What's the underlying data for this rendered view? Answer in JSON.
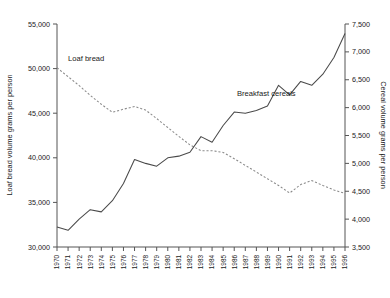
{
  "chart_data": {
    "type": "line",
    "title": "",
    "xlabel": "",
    "grid": false,
    "legend_position": "inline-annotation",
    "x": [
      1970,
      1971,
      1972,
      1973,
      1974,
      1975,
      1976,
      1977,
      1978,
      1979,
      1980,
      1981,
      1982,
      1983,
      1984,
      1985,
      1986,
      1987,
      1988,
      1989,
      1990,
      1991,
      1992,
      1993,
      1994,
      1995,
      1996
    ],
    "xtick_labels": [
      "1970",
      "1971",
      "1972",
      "1973",
      "1974",
      "1975",
      "1976",
      "1977",
      "1978",
      "1979",
      "1980",
      "1981",
      "1982",
      "1983",
      "1984",
      "1985",
      "1986",
      "1987",
      "1988",
      "1989",
      "1990",
      "1991",
      "1992",
      "1993",
      "1994",
      "1995",
      "1996"
    ],
    "axes": [
      {
        "id": "left",
        "label": "Loaf bread volume grams per person",
        "ylim": [
          30000,
          55000
        ],
        "tick_values": [
          30000,
          35000,
          40000,
          45000,
          50000,
          55000
        ],
        "tick_labels": [
          "30,000",
          "35,000",
          "40,000",
          "45,000",
          "50,000",
          "55,000"
        ]
      },
      {
        "id": "right",
        "label": "Cereal volume grams per person",
        "ylim": [
          3500,
          7500
        ],
        "tick_values": [
          3500,
          4000,
          4500,
          5000,
          5500,
          6000,
          6500,
          7000,
          7500
        ],
        "tick_labels": [
          "3,500",
          "4,000",
          "4,500",
          "5,000",
          "5,500",
          "6,000",
          "6,500",
          "7,000",
          "7,500"
        ]
      }
    ],
    "series": [
      {
        "name": "Loaf bread",
        "axis": "left",
        "style": "dashed",
        "color": "#8a8a8a",
        "annotation": "Loaf bread",
        "values": [
          50100,
          49100,
          48100,
          47000,
          46000,
          45100,
          45450,
          45750,
          45350,
          44400,
          43400,
          42400,
          41450,
          40800,
          40800,
          40600,
          39900,
          39150,
          38400,
          37650,
          36900,
          36050,
          37000,
          37450,
          36900,
          36400,
          36000
        ]
      },
      {
        "name": "Breakfast cereals",
        "axis": "right",
        "style": "solid",
        "color": "#4a4a4a",
        "annotation": "Breakfast cereals",
        "values": [
          3860,
          3800,
          4000,
          4170,
          4130,
          4330,
          4640,
          5070,
          5000,
          4950,
          5100,
          5130,
          5200,
          5480,
          5380,
          5680,
          5920,
          5900,
          5950,
          6030,
          6400,
          6230,
          6470,
          6400,
          6600,
          6900,
          7330
        ]
      }
    ]
  },
  "annotations": {
    "bread_label": "Loaf bread",
    "cereal_label": "Breakfast cereals"
  }
}
